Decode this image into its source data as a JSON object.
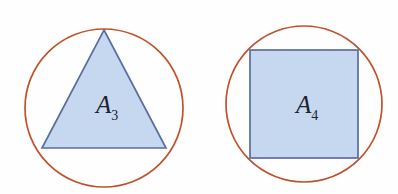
{
  "figure": {
    "background_color": "#fefefe",
    "width": 398,
    "height": 194,
    "circle_stroke_color": "#c0512c",
    "polygon_stroke_color": "#5a6ea5",
    "polygon_fill_color": "#c6d8ef"
  },
  "panels": [
    {
      "id": "triangle-panel",
      "shape": "equilateral-triangle",
      "label_base": "A",
      "label_sub": "3",
      "label_x": 96,
      "label_y": 113,
      "circle": {
        "cx": 104,
        "cy": 108,
        "r": 79
      },
      "points": "104,30 166,148 42,148"
    },
    {
      "id": "square-panel",
      "shape": "square",
      "label_base": "A",
      "label_sub": "4",
      "label_x": 296,
      "label_y": 113,
      "circle": {
        "cx": 304,
        "cy": 104,
        "r": 78
      },
      "rect": {
        "x": 250,
        "y": 50,
        "width": 108,
        "height": 108
      }
    }
  ]
}
